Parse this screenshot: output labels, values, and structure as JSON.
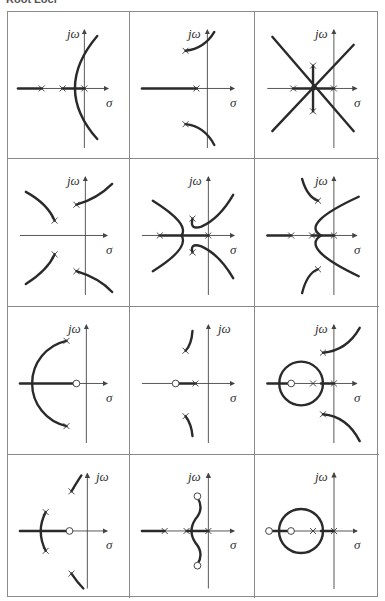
{
  "caption": "Root Loci",
  "labels": {
    "imag_axis": "jω",
    "real_axis": "σ"
  },
  "colors": {
    "locus": "#2a2a2a",
    "axis": "#444444",
    "border": "#8a8a8a",
    "background": "#ffffff"
  },
  "grid": {
    "rows": 4,
    "cols": 3
  },
  "cells": [
    {
      "id": "r1c1",
      "poles": 3,
      "zeros": 0,
      "description": "Three real poles; two branches bend into right half-plane"
    },
    {
      "id": "r1c2",
      "poles": 3,
      "zeros": 0,
      "description": "One real pole, complex pair; branches to asymptotes"
    },
    {
      "id": "r1c3",
      "poles": 4,
      "zeros": 0,
      "description": "Four poles; symmetric ±45° asymptotes through centroid"
    },
    {
      "id": "r2c1",
      "poles": 4,
      "zeros": 0,
      "description": "Two complex pole pairs; four separate branches"
    },
    {
      "id": "r2c2",
      "poles": 4,
      "zeros": 0,
      "description": "Two real poles and a complex pair; branches break away"
    },
    {
      "id": "r2c3",
      "poles": 5,
      "zeros": 0,
      "description": "Three real poles and a complex pair"
    },
    {
      "id": "r3c1",
      "poles": 2,
      "zeros": 1,
      "description": "Complex pole pair with real zero; circular arc"
    },
    {
      "id": "r3c2",
      "poles": 3,
      "zeros": 1,
      "description": "Real pole, complex pair, real zero"
    },
    {
      "id": "r3c3",
      "poles": 4,
      "zeros": 1,
      "description": "Two real poles, complex pair, zero; circle locus"
    },
    {
      "id": "r4c1",
      "poles": 4,
      "zeros": 1,
      "description": "Two complex pairs with a real zero"
    },
    {
      "id": "r4c2",
      "poles": 3,
      "zeros": 2,
      "description": "Three real poles with complex zero pair"
    },
    {
      "id": "r4c3",
      "poles": 2,
      "zeros": 2,
      "description": "Two real poles, two real zeros; circle locus"
    }
  ]
}
